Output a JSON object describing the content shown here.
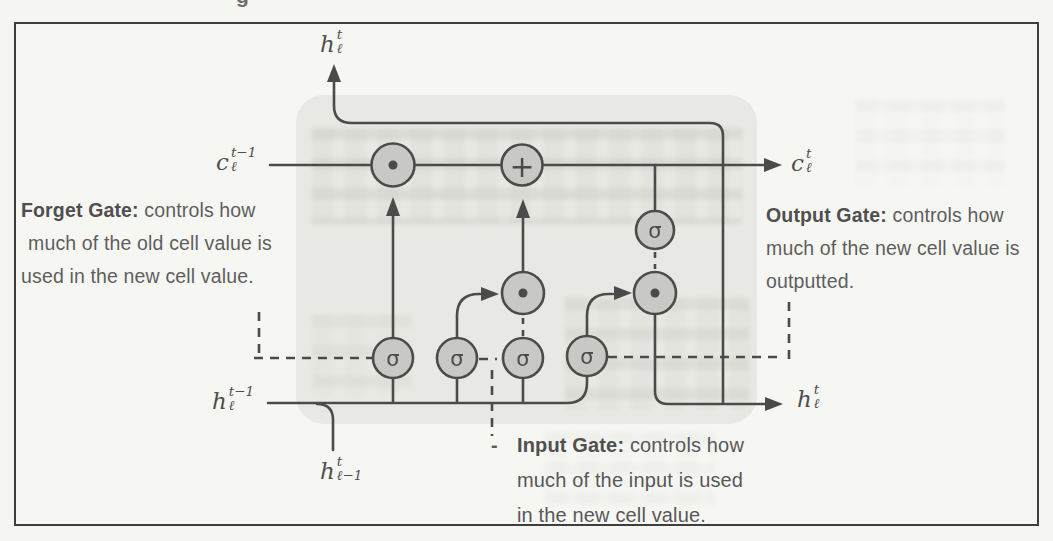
{
  "figure": {
    "type": "LSTM cell diagram (scanned textbook figure)",
    "colors": {
      "page_background": "#f5f5f2",
      "box_border": "#3e3e3e",
      "cell_body_fill": "#e8e8e4",
      "wire": "#4b4b4b",
      "node_fill": "#c8c8c5",
      "annotation_text": "#5e5e5e"
    },
    "stray_glyph": "g",
    "ops": {
      "sigma": "σ",
      "plus": "+"
    },
    "math": {
      "h_out_top": {
        "base": "h",
        "sup": "t",
        "sub": "ℓ"
      },
      "c_prev": {
        "base": "c",
        "sup": "t−1",
        "sub": "ℓ"
      },
      "c_out": {
        "base": "c",
        "sup": "t",
        "sub": "ℓ"
      },
      "h_prev": {
        "base": "h",
        "sup": "t−1",
        "sub": "ℓ"
      },
      "h_out_right": {
        "base": "h",
        "sup": "t",
        "sub": "ℓ"
      },
      "h_input_below": {
        "base": "h",
        "sup": "t",
        "sub": "ℓ−1"
      }
    },
    "annotations": {
      "forget": {
        "title": "Forget Gate:",
        "line1_rest": " controls how",
        "line2": "much of the old cell value is",
        "line3": "used in the new cell value."
      },
      "output": {
        "title": "Output Gate:",
        "line1_rest": " controls how",
        "line2": "much of the new cell value is",
        "line3": "outputted."
      },
      "input": {
        "marker": "-",
        "title": "Input Gate:",
        "line1_rest": " controls how",
        "line2": "much of the input is used",
        "line3": "in the new cell value."
      }
    }
  }
}
